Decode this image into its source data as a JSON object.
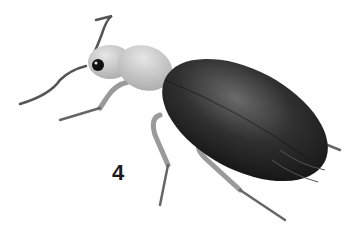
{
  "figure": {
    "label": "4",
    "colors": {
      "background": "#ffffff",
      "elytra": "#2a2a2a",
      "head_thorax": "#c8c8c8",
      "legs": "#b8b8b8",
      "label": "#1a1a1a"
    }
  }
}
